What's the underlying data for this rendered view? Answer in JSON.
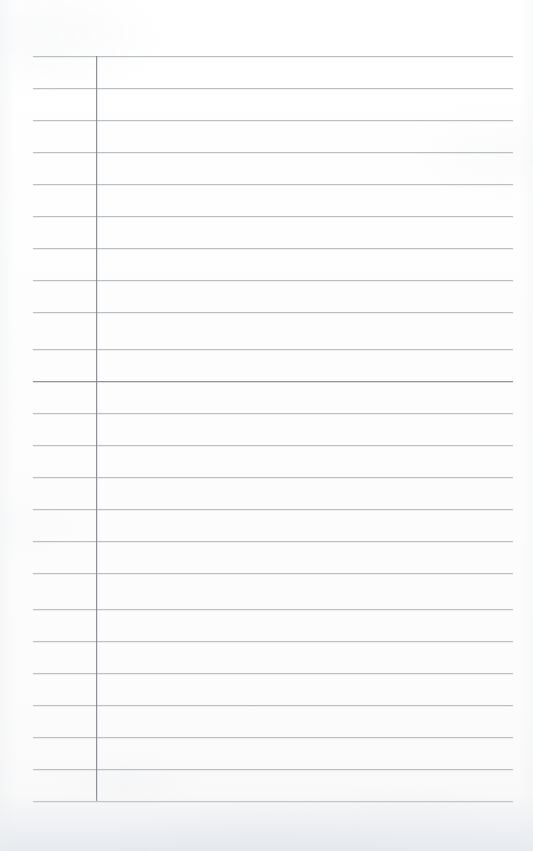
{
  "document": {
    "kind": "scanned-ruled-page",
    "title": "Blank ruled notebook page",
    "page_width": 533,
    "page_height": 851,
    "background_color": "#fdfdfd",
    "content_text": "",
    "handwriting_present": "none",
    "printed_text_present": "none"
  },
  "ruling": {
    "horizontal_rule_color": "#b9bdc2",
    "emphasis_rule_color": "#8d9197",
    "vertical_rule_color": "#85898f",
    "line_spacing_px": 32,
    "first_line_y": 56,
    "last_line_y": 801,
    "line_start_x": 33,
    "line_end_x": 513,
    "line_count": 24,
    "emphasis_line_index": 10,
    "vertical_rule_x": 96,
    "vertical_rule_top_y": 56,
    "vertical_rule_bottom_y": 801,
    "horizontal_line_y_positions": [
      56,
      88,
      120,
      152,
      184,
      216,
      248,
      280,
      312,
      349,
      381,
      413,
      445,
      477,
      509,
      541,
      573,
      609,
      641,
      673,
      705,
      737,
      769,
      801
    ]
  },
  "regions": {
    "margin_label": "left margin column",
    "body_label": "writing area",
    "top_blank_label": "top blank border",
    "bottom_blank_label": "bottom blank border"
  }
}
